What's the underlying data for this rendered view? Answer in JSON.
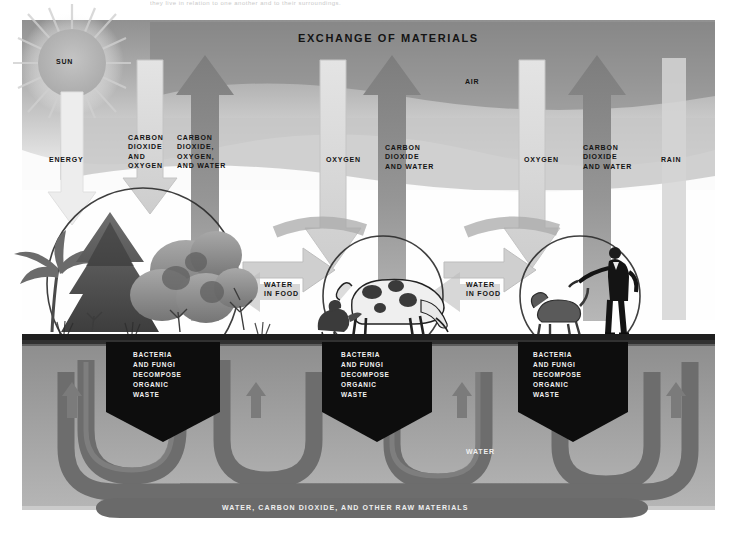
{
  "figure": {
    "title": "EXCHANGE OF MATERIALS",
    "top_cut_caption": "they live in relation to one another and to their surroundings.",
    "domain_kind": "diagram"
  },
  "colors": {
    "paper": "#ffffff",
    "sky": "#b9b9b9",
    "sky_dark": "#8e8e8e",
    "arrow_up": "#8c8c8c",
    "arrow_down": "#d8d8d8",
    "ground": "#2b2b2b",
    "soil": "#9a9a9a",
    "pipe": "#6f6f6f",
    "box": "#101010",
    "box_text": "#f2f2f2",
    "text": "#141414",
    "sun": "#b5b5b5"
  },
  "labels": {
    "sun": "SUN",
    "air": "AIR",
    "energy": "ENERGY",
    "water_ground": "WATER",
    "bottom_band": "WATER, CARBON DIOXIDE, AND OTHER RAW MATERIALS",
    "co2_and_oxygen": "CARBON\nDIOXIDE\nAND\nOXYGEN",
    "co2_oxygen_water": "CARBON\nDIOXIDE,\nOXYGEN,\nAND WATER",
    "oxygen_1": "OXYGEN",
    "co2_and_water_1": "CARBON\nDIOXIDE\nAND WATER",
    "oxygen_2": "OXYGEN",
    "co2_and_water_2": "CARBON\nDIOXIDE\nAND WATER",
    "rain": "RAIN",
    "water_in_food_1": "WATER\nIN FOOD",
    "water_in_food_2": "WATER\nIN FOOD"
  },
  "decomposer_boxes": [
    {
      "id": "plants",
      "text": "BACTERIA\nAND FUNGI\nDECOMPOSE\nORGANIC\nWASTE"
    },
    {
      "id": "animals",
      "text": "BACTERIA\nAND FUNGI\nDECOMPOSE\nORGANIC\nWASTE"
    },
    {
      "id": "humans",
      "text": "BACTERIA\nAND FUNGI\nDECOMPOSE\nORGANIC\nWASTE"
    }
  ],
  "scene_groups": [
    {
      "id": "producers",
      "contents": "palm tree, conifer, shrubs, grasses"
    },
    {
      "id": "consumers-animals",
      "contents": "grazing cow, chicken"
    },
    {
      "id": "consumers-humans",
      "contents": "man in suit, dog"
    }
  ],
  "arrows": {
    "up": [
      {
        "id": "up-plants",
        "label_ref": "co2_oxygen_water"
      },
      {
        "id": "up-animals",
        "label_ref": "co2_and_water_1"
      },
      {
        "id": "up-humans",
        "label_ref": "co2_and_water_2"
      }
    ],
    "down": [
      {
        "id": "down-sun-energy",
        "label_ref": "energy"
      },
      {
        "id": "down-co2-oxygen",
        "label_ref": "co2_and_oxygen"
      },
      {
        "id": "down-oxygen-animals",
        "label_ref": "oxygen_1"
      },
      {
        "id": "down-oxygen-humans",
        "label_ref": "oxygen_2"
      },
      {
        "id": "down-rain",
        "label_ref": "rain"
      }
    ],
    "food_flow": [
      {
        "id": "plants-to-animals",
        "label_ref": "water_in_food_1"
      },
      {
        "id": "animals-to-humans",
        "label_ref": "water_in_food_2"
      }
    ]
  }
}
